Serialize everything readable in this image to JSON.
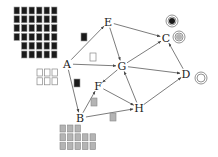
{
  "diagram": {
    "type": "directed-graph",
    "nodes": [
      {
        "id": "A",
        "label": "A",
        "x": 67,
        "y": 64
      },
      {
        "id": "E",
        "label": "E",
        "x": 108,
        "y": 22
      },
      {
        "id": "G",
        "label": "G",
        "x": 122,
        "y": 66
      },
      {
        "id": "C",
        "label": "C",
        "x": 166,
        "y": 38
      },
      {
        "id": "D",
        "label": "D",
        "x": 186,
        "y": 74
      },
      {
        "id": "F",
        "label": "F",
        "x": 98,
        "y": 86
      },
      {
        "id": "H",
        "label": "H",
        "x": 139,
        "y": 108
      },
      {
        "id": "B",
        "label": "B",
        "x": 80,
        "y": 118
      }
    ],
    "edges": [
      {
        "from": "A",
        "to": "E"
      },
      {
        "from": "A",
        "to": "G"
      },
      {
        "from": "A",
        "to": "B"
      },
      {
        "from": "E",
        "to": "G"
      },
      {
        "from": "E",
        "to": "C"
      },
      {
        "from": "G",
        "to": "C"
      },
      {
        "from": "G",
        "to": "D"
      },
      {
        "from": "G",
        "to": "F"
      },
      {
        "from": "H",
        "to": "G"
      },
      {
        "from": "F",
        "to": "H"
      },
      {
        "from": "B",
        "to": "F"
      },
      {
        "from": "B",
        "to": "H"
      },
      {
        "from": "D",
        "to": "C"
      },
      {
        "from": "H",
        "to": "D"
      }
    ],
    "edge_markers": [
      {
        "edge": "A-E",
        "style": "black",
        "x": 84,
        "y": 37
      },
      {
        "edge": "A-G",
        "style": "white",
        "x": 93,
        "y": 57
      },
      {
        "edge": "A-B",
        "style": "black",
        "x": 77,
        "y": 83
      },
      {
        "edge": "B-F",
        "style": "gray",
        "x": 94,
        "y": 102
      },
      {
        "edge": "B-H",
        "style": "gray",
        "x": 113,
        "y": 117
      }
    ],
    "target_symbols": [
      {
        "near": "C",
        "style": "black-dot",
        "x": 172,
        "y": 21
      },
      {
        "near": "C",
        "style": "gray-dot",
        "x": 179,
        "y": 37
      },
      {
        "near": "D",
        "style": "empty",
        "x": 201,
        "y": 78
      }
    ],
    "grids": [
      {
        "name": "black-grid",
        "style": "black",
        "x": 14,
        "y": 7,
        "rows": [
          {
            "offset": 0,
            "count": 6
          },
          {
            "offset": 0,
            "count": 6
          },
          {
            "offset": 0,
            "count": 6
          },
          {
            "offset": 0,
            "count": 6
          },
          {
            "offset": 1,
            "count": 5
          },
          {
            "offset": 1,
            "count": 5
          }
        ]
      },
      {
        "name": "white-grid",
        "style": "white",
        "x": 37,
        "y": 69,
        "rows": [
          {
            "offset": 0,
            "count": 3
          },
          {
            "offset": 0,
            "count": 3
          }
        ]
      },
      {
        "name": "gray-grid",
        "style": "gray",
        "x": 60,
        "y": 125,
        "rows": [
          {
            "offset": 0,
            "count": 3
          },
          {
            "offset": 0,
            "count": 5
          },
          {
            "offset": 0,
            "count": 5
          }
        ]
      }
    ],
    "colors": {
      "black": "#1a1a1a",
      "gray": "#b4b4b4",
      "white": "#ffffff",
      "edge": "#444444",
      "outline": "#888888"
    }
  }
}
